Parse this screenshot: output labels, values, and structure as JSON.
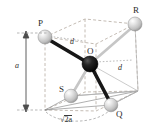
{
  "figure": {
    "type": "geometry-diagram",
    "background_color": "#ffffff",
    "colors": {
      "cube_edge": "#b9b0a8",
      "sphere_light": "#d4d4d4",
      "sphere_dark": "#111111",
      "bond_dark": "#1a1a1a",
      "bond_light": "#c9c9c9",
      "label_text": "#2b2b2b",
      "dimension_line": "#5a5a5a"
    },
    "atoms": [
      {
        "id": "P",
        "label": "P",
        "fill": "light",
        "cx": 45,
        "cy": 37,
        "r": 7
      },
      {
        "id": "R",
        "label": "R",
        "fill": "light",
        "cx": 135,
        "cy": 24,
        "r": 7
      },
      {
        "id": "O",
        "label": "O",
        "fill": "dark",
        "cx": 90,
        "cy": 64,
        "r": 8
      },
      {
        "id": "S",
        "label": "S",
        "fill": "light",
        "cx": 71,
        "cy": 96,
        "r": 7
      },
      {
        "id": "Q",
        "label": "Q",
        "fill": "light",
        "cx": 111,
        "cy": 105,
        "r": 7
      }
    ],
    "bonds": [
      {
        "from": "P",
        "to": "O",
        "style": "dark-thick"
      },
      {
        "from": "O",
        "to": "Q",
        "style": "dark-thick"
      },
      {
        "from": "O",
        "to": "R",
        "style": "light-thin"
      },
      {
        "from": "O",
        "to": "S",
        "style": "light-thin"
      }
    ],
    "measure_labels": [
      {
        "id": "d-top",
        "text": "d",
        "x": 70,
        "y": 38,
        "italic": true
      },
      {
        "id": "d-right",
        "text": "d",
        "x": 118,
        "y": 64,
        "italic": true
      },
      {
        "id": "a-left",
        "text": "a",
        "x": 17,
        "y": 62,
        "italic": true
      }
    ],
    "diagonal_label": {
      "id": "sqrt2a",
      "radical": "√",
      "text": "2a",
      "full": "√2a",
      "x": 63,
      "y": 116
    },
    "dimension": {
      "name": "cube-height",
      "symbol": "a",
      "orientation": "vertical",
      "x": 26,
      "y_top": 33,
      "y_bottom": 110
    },
    "cube": {
      "edge_style": "dashed",
      "vertices_front_top": [
        [
          48,
          33
        ],
        [
          48,
          90
        ]
      ],
      "note": "cube drawn with dashed construction lines"
    }
  }
}
